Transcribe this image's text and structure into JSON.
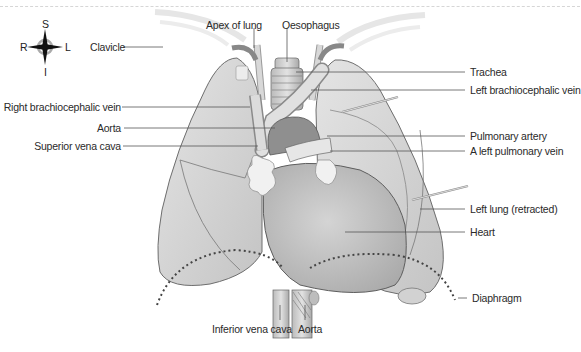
{
  "figure": {
    "compass": {
      "superior": "S",
      "inferior": "I",
      "right": "R",
      "left": "L"
    },
    "labels_left": {
      "clavicle": "Clavicle",
      "right_brachiocephalic_vein": "Right brachiocephalic vein",
      "aorta_upper": "Aorta",
      "superior_vena_cava": "Superior vena cava"
    },
    "labels_top": {
      "apex_of_lung": "Apex of lung",
      "oesophagus": "Oesophagus"
    },
    "labels_right": {
      "trachea": "Trachea",
      "left_brachiocephalic_vein": "Left brachiocephalic vein",
      "pulmonary_artery": "Pulmonary artery",
      "left_pulmonary_vein": "A left pulmonary vein",
      "left_lung": "Left lung (retracted)",
      "heart": "Heart",
      "diaphragm": "Diaphragm"
    },
    "labels_bottom": {
      "inferior_vena_cava": "Inferior vena cava",
      "aorta_lower": "Aorta"
    },
    "colors": {
      "lung": "#d6d6d6",
      "lung_edge": "#6e6e6e",
      "heart": "#bdbdbd",
      "vessel": "#cfcfcf",
      "leader": "#555555",
      "text": "#2a2a2a"
    }
  }
}
